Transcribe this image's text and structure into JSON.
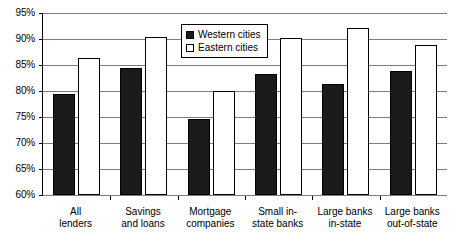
{
  "chart_data": {
    "type": "bar",
    "title": "",
    "subtitle": "",
    "xlabel": "",
    "ylabel": "",
    "categories": [
      "All lenders",
      "Savings and loans",
      "Mortgage companies",
      "Small in-state banks",
      "Large banks in-state",
      "Large banks out-of-state"
    ],
    "category_lines": [
      [
        "All",
        "lenders"
      ],
      [
        "Savings",
        "and loans"
      ],
      [
        "Mortgage",
        "companies"
      ],
      [
        "Small in-",
        "state banks"
      ],
      [
        "Large banks",
        "in-state"
      ],
      [
        "Large banks",
        "out-of-state"
      ]
    ],
    "series": [
      {
        "name": "Western cities",
        "color": "#1a1a1a",
        "values": [
          79.5,
          84.5,
          74.6,
          83.2,
          81.4,
          83.9
        ]
      },
      {
        "name": "Eastern cities",
        "color": "#ffffff",
        "values": [
          86.3,
          90.4,
          80.0,
          90.2,
          92.1,
          88.8
        ]
      }
    ],
    "ylim": [
      60,
      95
    ],
    "ytick_step": 5,
    "ytick_labels": [
      "95%",
      "90%",
      "85%",
      "80%",
      "75%",
      "70%",
      "65%",
      "60%"
    ],
    "ytick_values": [
      95,
      90,
      85,
      80,
      75,
      70,
      65,
      60
    ],
    "value_suffix": "%",
    "grid": true,
    "grid_axis": "y",
    "legend_position": "upper-center-right",
    "legend": [
      "Western cities",
      "Eastern cities"
    ]
  }
}
